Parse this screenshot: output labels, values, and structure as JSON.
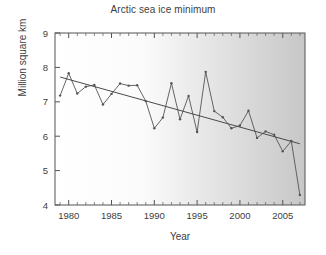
{
  "chart_data": {
    "type": "line",
    "title": "Arctic sea ice minimum",
    "xlabel": "Year",
    "ylabel": "Million square km",
    "xlim": [
      1978.4,
      2007.6
    ],
    "ylim": [
      4,
      9
    ],
    "grid": false,
    "legend": null,
    "x_ticks": [
      1980,
      1985,
      1990,
      1995,
      2000,
      2005
    ],
    "x_tick_labels": [
      "1980",
      "1985",
      "1990",
      "1995",
      "2000",
      "2005"
    ],
    "x_minor_tick_step": 1,
    "y_ticks": [
      4,
      5,
      6,
      7,
      8,
      9
    ],
    "y_tick_labels": [
      "4",
      "5",
      "6",
      "7",
      "8",
      "9"
    ],
    "x": [
      1979,
      1980,
      1981,
      1982,
      1983,
      1984,
      1985,
      1986,
      1987,
      1988,
      1989,
      1990,
      1991,
      1992,
      1993,
      1994,
      1995,
      1996,
      1997,
      1998,
      1999,
      2000,
      2001,
      2002,
      2003,
      2004,
      2005,
      2006,
      2007
    ],
    "series": [
      {
        "name": "Arctic sea ice minimum extent",
        "marker": "dot",
        "color": "#555555",
        "values": [
          7.18,
          7.83,
          7.24,
          7.44,
          7.49,
          6.92,
          7.23,
          7.53,
          7.47,
          7.48,
          7.02,
          6.23,
          6.54,
          7.54,
          6.49,
          7.17,
          6.12,
          7.87,
          6.73,
          6.55,
          6.23,
          6.31,
          6.74,
          5.95,
          6.14,
          6.04,
          5.56,
          5.86,
          4.29
        ]
      }
    ],
    "trend_line": {
      "name": "Linear trend",
      "color": "#4a4a4a",
      "x_start": 1979,
      "y_start": 7.72,
      "x_end": 2007,
      "y_end": 5.78
    },
    "background": {
      "gradient": "left-to-right white to light gray",
      "from": "#ffffff",
      "to": "#c9c9c9"
    },
    "frame_color": "#555555"
  }
}
